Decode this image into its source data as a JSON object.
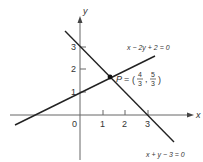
{
  "diagram": {
    "type": "coordinate-plane-lines",
    "axes": {
      "x_label": "x",
      "y_label": "y",
      "origin_label": "0",
      "x_ticks": [
        "1",
        "2",
        "3"
      ],
      "y_ticks": [
        "1",
        "2",
        "3"
      ]
    },
    "lines": [
      {
        "equation": "x − 2y + 2 = 0"
      },
      {
        "equation": "x + y − 3 = 0"
      }
    ],
    "intersection": {
      "label": "P",
      "equals": "=",
      "x_num": "4",
      "x_den": "3",
      "y_num": "5",
      "y_den": "3"
    },
    "colors": {
      "line": "#222222",
      "axis": "#555555",
      "text": "#333333"
    }
  }
}
